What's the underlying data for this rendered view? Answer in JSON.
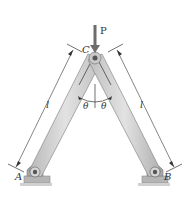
{
  "figure": {
    "labels": {
      "force": "P",
      "pin_top": "C",
      "pin_left": "A",
      "pin_right": "B",
      "length_left": "l",
      "length_right": "l",
      "angle_left": "θ",
      "angle_right": "θ"
    },
    "colors": {
      "bar_fill": "#cfcfcf",
      "bar_edge": "#8a8a8a",
      "bar_highlight": "#e6e6e6",
      "pin": "#9a9a9a",
      "ground": "#bdbdbd",
      "arrow": "#6d6d6d",
      "line": "#333333"
    }
  }
}
